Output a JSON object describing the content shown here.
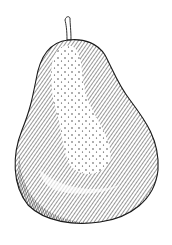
{
  "image": {
    "subject": "pear",
    "style": "pen-and-ink stipple and hatching illustration",
    "background": "#ffffff",
    "ink": "#1a1a1a"
  }
}
